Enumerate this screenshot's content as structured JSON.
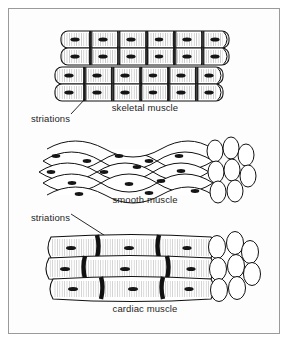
{
  "figure": {
    "background_color": "#fdfdfd",
    "border_color": "#9a9a9a",
    "ink_color": "#111111"
  },
  "labels": {
    "skeletal": "skeletal muscle",
    "smooth": "smooth muscle",
    "cardiac": "cardiac muscle",
    "striations_top": "striations",
    "striations_bottom": "striations"
  },
  "panels": [
    {
      "id": "skeletal",
      "caption": "skeletal muscle",
      "structure": "grid of cylindrical striated fibers",
      "rows": 4,
      "columns": 6,
      "features": [
        "striations",
        "nuclei",
        "banded cross bands"
      ]
    },
    {
      "id": "smooth",
      "caption": "smooth muscle",
      "structure": "interwoven spindle-shaped cells with cut end",
      "rows": 5,
      "features": [
        "tapered fusiform cells",
        "central nuclei",
        "cut-end cross sections"
      ]
    },
    {
      "id": "cardiac",
      "caption": "cardiac muscle",
      "structure": "branching striated fibers with intercalated discs",
      "rows": 3,
      "features": [
        "intercalated discs",
        "striations",
        "nuclei",
        "cut-end cross sections"
      ]
    }
  ],
  "leader_lines": [
    {
      "from": "striations_top",
      "to": "skeletal muscle striation band"
    },
    {
      "from": "striations_bottom",
      "to": "cardiac muscle striation band"
    }
  ]
}
